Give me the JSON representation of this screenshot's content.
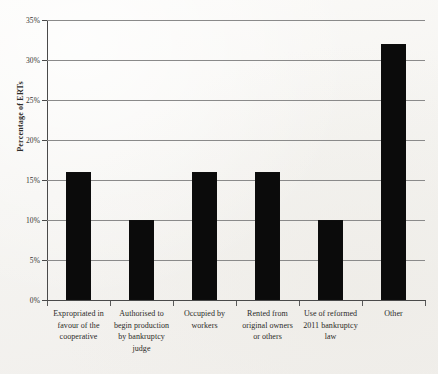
{
  "chart_data": {
    "type": "bar",
    "title": "",
    "subtitle": "",
    "xlabel": "",
    "ylabel": "Percentage of ERTs",
    "ylim": [
      0,
      35
    ],
    "ytick_step": 5,
    "ytick_labels": [
      "0%",
      "5%",
      "10%",
      "15%",
      "20%",
      "25%",
      "30%",
      "35%"
    ],
    "ytick_values": [
      0,
      5,
      10,
      15,
      20,
      25,
      30,
      35
    ],
    "grid": "horizontal",
    "legend": "none",
    "bar_color": "#0b0b0b",
    "categories": [
      "Expropriated in favour of the cooperative",
      "Authorised to begin production by bankruptcy judge",
      "Occupied by workers",
      "Rented from original owners or others",
      "Use of reformed 2011 bankruptcy law",
      "Other"
    ],
    "category_lines": [
      [
        "Expropriated in",
        "favour of the",
        "cooperative"
      ],
      [
        "Authorised to",
        "begin production",
        "by bankruptcy",
        "judge"
      ],
      [
        "Occupied by",
        "workers"
      ],
      [
        "Rented from",
        "original owners",
        "or others"
      ],
      [
        "Use of reformed",
        "2011 bankruptcy",
        "law"
      ],
      [
        "Other"
      ]
    ],
    "values": [
      16,
      10,
      16,
      16,
      10,
      32
    ],
    "value_labels": [
      "16%",
      "10%",
      "16%",
      "16%",
      "10%",
      "32%"
    ]
  },
  "colors": {
    "bar": "#0b0b0b",
    "gridline": "#8a8a8a",
    "axis": "#4a4a4a",
    "text": "#2b2a28",
    "background": "#f7f6f3"
  }
}
